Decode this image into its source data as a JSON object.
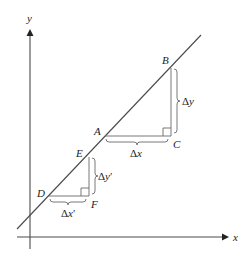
{
  "diagram": {
    "axes": {
      "x_label": "x",
      "y_label": "y"
    },
    "points": {
      "A": "A",
      "B": "B",
      "C": "C",
      "D": "D",
      "E": "E",
      "F": "F"
    },
    "measures": {
      "delta_x": {
        "sym": "Δ",
        "var": "x",
        "prime": ""
      },
      "delta_y": {
        "sym": "Δ",
        "var": "y",
        "prime": ""
      },
      "delta_x_prime": {
        "sym": "Δ",
        "var": "x",
        "prime": "′"
      },
      "delta_y_prime": {
        "sym": "Δ",
        "var": "y",
        "prime": "′"
      }
    },
    "colors": {
      "stroke": "#4a4a4a",
      "text": "#222222"
    }
  }
}
